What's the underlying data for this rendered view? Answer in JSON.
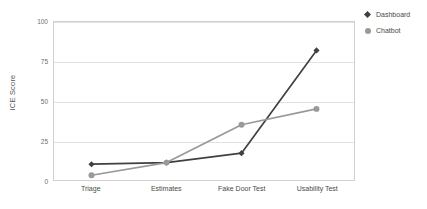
{
  "chart_data": {
    "type": "line",
    "title": "",
    "xlabel": "",
    "ylabel": "ICE Score",
    "categories": [
      "Triage",
      "Estimates",
      "Fake Door Test",
      "Usability Test"
    ],
    "yticks": [
      0,
      25,
      50,
      75,
      100
    ],
    "ylim": [
      0,
      100
    ],
    "grid": true,
    "legend_position": "top-right",
    "series": [
      {
        "name": "Dashboard",
        "values": [
          10,
          11,
          17,
          82
        ],
        "color": "#404040",
        "marker": "diamond"
      },
      {
        "name": "Chatbot",
        "values": [
          3,
          11,
          35,
          45
        ],
        "color": "#999999",
        "marker": "circle"
      }
    ]
  },
  "legend": {
    "items": [
      {
        "label": "Dashboard",
        "marker": "diamond-marker-icon"
      },
      {
        "label": "Chatbot",
        "marker": "circle-marker-icon"
      }
    ]
  }
}
